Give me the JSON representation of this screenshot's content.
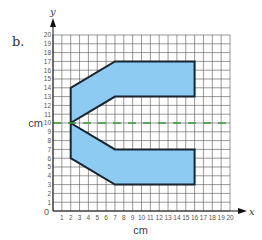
{
  "figure": {
    "part_label": "b.",
    "x_axis": {
      "name": "x",
      "unit_label": "cm",
      "min": 0,
      "max": 20,
      "ticks": [
        "1",
        "2",
        "3",
        "4",
        "5",
        "6",
        "7",
        "8",
        "9",
        "10",
        "11",
        "12",
        "13",
        "14",
        "15",
        "16",
        "17",
        "18",
        "19",
        "20"
      ]
    },
    "y_axis": {
      "name": "y",
      "unit_label": "cm",
      "min": 0,
      "max": 20,
      "ticks": [
        "1",
        "2",
        "3",
        "4",
        "5",
        "6",
        "7",
        "8",
        "9",
        "10",
        "11",
        "12",
        "13",
        "14",
        "15",
        "16",
        "17",
        "18",
        "19",
        "20"
      ]
    },
    "origin_label": "0",
    "shape": {
      "fill": "#8ecbf2",
      "stroke": "#1a2530",
      "vertices": [
        [
          2,
          14
        ],
        [
          7,
          17
        ],
        [
          16,
          17
        ],
        [
          16,
          13
        ],
        [
          7,
          13
        ],
        [
          2,
          10
        ],
        [
          7,
          7
        ],
        [
          16,
          7
        ],
        [
          16,
          3
        ],
        [
          7,
          3
        ],
        [
          2,
          6
        ]
      ]
    },
    "line_of_symmetry": {
      "y": 10,
      "color": "#3a9a3a",
      "style": "dashed"
    },
    "grid_color": "#555555"
  }
}
